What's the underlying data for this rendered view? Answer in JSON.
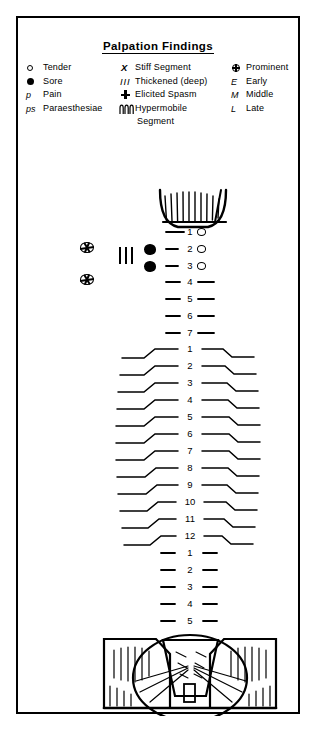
{
  "document": {
    "title": "Palpation Findings",
    "border_color": "#000000",
    "background": "#ffffff"
  },
  "legend": {
    "columns": [
      {
        "id": "column-1",
        "entries": [
          {
            "symbol": "open-circle",
            "glyph": "○",
            "label": "Tender"
          },
          {
            "symbol": "filled-circle",
            "glyph": "●",
            "label": "Sore"
          },
          {
            "symbol": "letter-p",
            "glyph": "p",
            "label": "Pain"
          },
          {
            "symbol": "letters-ps",
            "glyph": "ps",
            "label": "Paraesthesiae"
          }
        ]
      },
      {
        "id": "column-2",
        "entries": [
          {
            "symbol": "letter-x",
            "glyph": "X",
            "label": "Stiff Segment"
          },
          {
            "symbol": "triple-bar",
            "glyph": "III",
            "label": "Thickened (deep)"
          },
          {
            "symbol": "spasm-cross",
            "glyph": "☨",
            "label": "Elicited Spasm"
          },
          {
            "symbol": "coil-wave",
            "glyph": "ՈՈՈ",
            "label": "Hypermobile",
            "label_line2": "Segment"
          }
        ]
      },
      {
        "id": "column-3",
        "entries": [
          {
            "symbol": "crossed-circle",
            "glyph": "⊕",
            "label": "Prominent"
          },
          {
            "symbol": "letter-e",
            "glyph": "E",
            "label": "Early"
          },
          {
            "symbol": "letter-m",
            "glyph": "M",
            "label": "Middle"
          },
          {
            "symbol": "letter-l",
            "glyph": "L",
            "label": "Late"
          }
        ]
      }
    ]
  },
  "spine_chart": {
    "type": "anatomical-diagram",
    "regions": [
      {
        "name": "occiput",
        "label": "Occiput",
        "shape": "hatched-u-curve"
      },
      {
        "name": "cervical",
        "label": "Cervical",
        "levels": [
          "1",
          "2",
          "3",
          "4",
          "5",
          "6",
          "7"
        ]
      },
      {
        "name": "thoracic",
        "label": "Thoracic",
        "levels": [
          "1",
          "2",
          "3",
          "4",
          "5",
          "6",
          "7",
          "8",
          "9",
          "10",
          "11",
          "12"
        ]
      },
      {
        "name": "lumbar",
        "label": "Lumbar",
        "levels": [
          "1",
          "2",
          "3",
          "4",
          "5"
        ]
      },
      {
        "name": "sacrum-pelvis",
        "label": "Sacrum / Pelvis",
        "shape": "trapezoid-sacrum-with-hatched-ilia"
      }
    ],
    "annotations": [
      {
        "level": "C1",
        "side": "right",
        "marking": "open-circle",
        "meaning": "Tender"
      },
      {
        "level": "C2",
        "side": "right",
        "marking": "open-circle",
        "meaning": "Tender"
      },
      {
        "level": "C3",
        "side": "right",
        "marking": "open-circle",
        "meaning": "Tender"
      },
      {
        "level": "C2",
        "side": "left",
        "marking": "filled-circle",
        "meaning": "Sore"
      },
      {
        "level": "C3",
        "side": "left",
        "marking": "filled-circle",
        "meaning": "Sore"
      },
      {
        "level": "C2-C3",
        "side": "left",
        "marking": "triple-bar",
        "meaning": "Thickened (deep)"
      },
      {
        "level": "C2",
        "side": "far-left",
        "marking": "crossed-circle",
        "meaning": "Prominent"
      },
      {
        "level": "C3",
        "side": "far-left",
        "marking": "crossed-circle",
        "meaning": "Prominent"
      }
    ]
  }
}
